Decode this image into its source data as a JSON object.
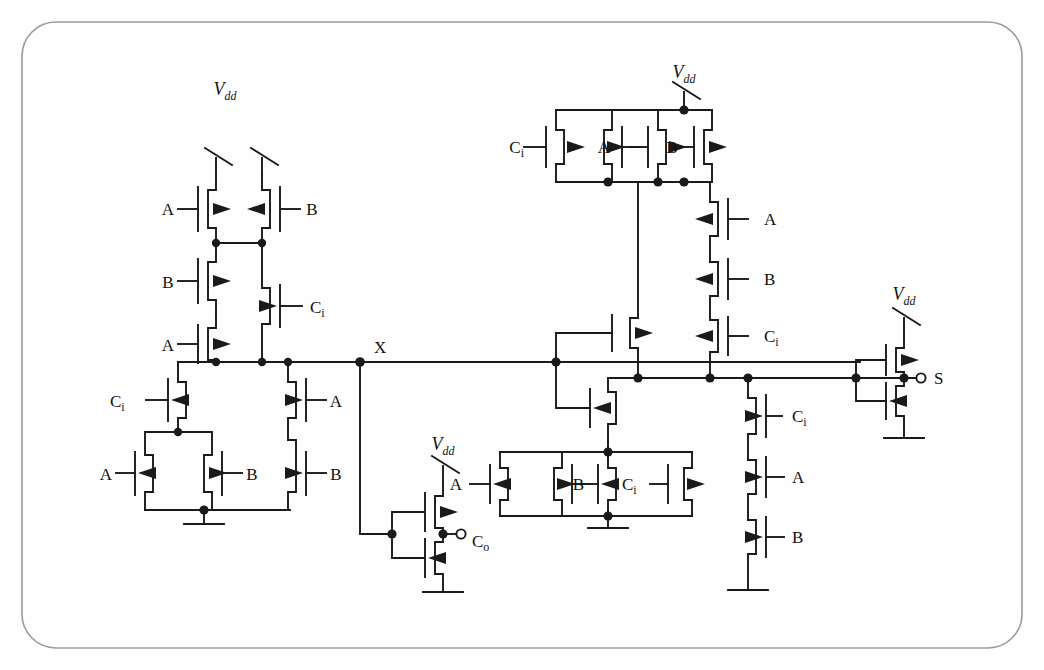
{
  "figure": {
    "kind": "cmos-circuit-schematic",
    "background": "#fefefe",
    "wire_color": "#1a1a1a",
    "border": {
      "shape": "rounded-rectangle",
      "color": "#8a8a8a",
      "radius": 34
    }
  },
  "signals": {
    "a": "A",
    "b": "B",
    "ci": "C",
    "ci_sub": "i",
    "co": "C",
    "co_sub": "o",
    "sum": "S",
    "vdd": "V",
    "vdd_sub": "dd",
    "node_x": "X"
  },
  "nets": [
    {
      "name": "X",
      "label": "X",
      "type": "internal-node"
    },
    {
      "name": "Co",
      "label": "C_o",
      "type": "output-terminal"
    },
    {
      "name": "S",
      "label": "S",
      "type": "output-terminal"
    }
  ],
  "blocks": [
    {
      "id": "carry-pull-up",
      "role": "PMOS pull-up network for carry (drives node X)",
      "supply": "Vdd",
      "devices": [
        {
          "id": "p-a-top",
          "type": "pmos",
          "gate": "A"
        },
        {
          "id": "p-b-top",
          "type": "pmos",
          "gate": "B"
        },
        {
          "id": "p-b-mid",
          "type": "pmos",
          "gate": "B"
        },
        {
          "id": "p-a-mid",
          "type": "pmos",
          "gate": "A"
        },
        {
          "id": "p-ci-right",
          "type": "pmos",
          "gate": "Ci"
        }
      ]
    },
    {
      "id": "carry-pull-down",
      "role": "NMOS pull-down network for carry (drives node X)",
      "ground": true,
      "devices": [
        {
          "id": "n-ci-left",
          "type": "nmos",
          "gate": "Ci"
        },
        {
          "id": "n-a-par",
          "type": "nmos",
          "gate": "A"
        },
        {
          "id": "n-b-par",
          "type": "nmos",
          "gate": "B"
        },
        {
          "id": "n-a-ser",
          "type": "nmos",
          "gate": "A"
        },
        {
          "id": "n-b-ser",
          "type": "nmos",
          "gate": "B"
        }
      ]
    },
    {
      "id": "carry-inverter",
      "role": "Inverter from node X to carry out",
      "supply": "Vdd",
      "output": "Co",
      "devices": [
        {
          "id": "inv-co-p",
          "type": "pmos",
          "gate": "X"
        },
        {
          "id": "inv-co-n",
          "type": "nmos",
          "gate": "X"
        }
      ]
    },
    {
      "id": "sum-pull-up",
      "role": "PMOS network for sum",
      "supply": "Vdd",
      "devices": [
        {
          "id": "sp-ci",
          "type": "pmos",
          "gate": "Ci"
        },
        {
          "id": "sp-a",
          "type": "pmos",
          "gate": "A"
        },
        {
          "id": "sp-b",
          "type": "pmos",
          "gate": "B"
        },
        {
          "id": "sp-x",
          "type": "pmos",
          "gate": "X"
        },
        {
          "id": "sp-ser-a",
          "type": "pmos",
          "gate": "A"
        },
        {
          "id": "sp-ser-b",
          "type": "pmos",
          "gate": "B"
        },
        {
          "id": "sp-ser-ci",
          "type": "pmos",
          "gate": "Ci"
        }
      ]
    },
    {
      "id": "sum-pull-down",
      "role": "NMOS network for sum",
      "ground": true,
      "devices": [
        {
          "id": "sn-x",
          "type": "nmos",
          "gate": "X"
        },
        {
          "id": "sn-a",
          "type": "nmos",
          "gate": "A"
        },
        {
          "id": "sn-b",
          "type": "nmos",
          "gate": "B"
        },
        {
          "id": "sn-ci",
          "type": "nmos",
          "gate": "Ci"
        },
        {
          "id": "sn-x2",
          "type": "nmos",
          "gate": "X"
        },
        {
          "id": "sn-ser-ci",
          "type": "nmos",
          "gate": "Ci"
        },
        {
          "id": "sn-ser-a",
          "type": "nmos",
          "gate": "A"
        },
        {
          "id": "sn-ser-b",
          "type": "nmos",
          "gate": "B"
        }
      ]
    },
    {
      "id": "sum-inverter",
      "role": "Output inverter producing S",
      "supply": "Vdd",
      "output": "S",
      "devices": [
        {
          "id": "inv-s-p",
          "type": "pmos"
        },
        {
          "id": "inv-s-n",
          "type": "nmos"
        }
      ]
    }
  ],
  "labels": [
    {
      "id": "vdd-left",
      "text": "Vdd",
      "x": 225,
      "y": 95
    },
    {
      "id": "a-left-1",
      "text": "A",
      "x": 168,
      "y": 207
    },
    {
      "id": "b-left-1",
      "text": "B",
      "x": 312,
      "y": 207
    },
    {
      "id": "b-left-2",
      "text": "B",
      "x": 168,
      "y": 285
    },
    {
      "id": "ci-left-1",
      "text": "Ci",
      "x": 312,
      "y": 312
    },
    {
      "id": "a-left-2",
      "text": "A",
      "x": 168,
      "y": 327
    },
    {
      "id": "ci-left-2",
      "text": "Ci",
      "x": 125,
      "y": 405
    },
    {
      "id": "a-left-3",
      "text": "A",
      "x": 318,
      "y": 405
    },
    {
      "id": "a-left-4",
      "text": "A",
      "x": 132,
      "y": 478
    },
    {
      "id": "b-left-3",
      "text": "B",
      "x": 246,
      "y": 478
    },
    {
      "id": "b-left-4",
      "text": "B",
      "x": 318,
      "y": 478
    },
    {
      "id": "x-node",
      "text": "X",
      "x": 372,
      "y": 353
    },
    {
      "id": "vdd-co",
      "text": "Vdd",
      "x": 432,
      "y": 442
    },
    {
      "id": "co-term",
      "text": "Co",
      "x": 470,
      "y": 546
    },
    {
      "id": "ci-top-right",
      "text": "Ci",
      "x": 540,
      "y": 148
    },
    {
      "id": "a-top-right",
      "text": "A",
      "x": 610,
      "y": 148
    },
    {
      "id": "b-top-right",
      "text": "B",
      "x": 682,
      "y": 148
    },
    {
      "id": "a-ser-right",
      "text": "A",
      "x": 762,
      "y": 230
    },
    {
      "id": "b-ser-right",
      "text": "B",
      "x": 762,
      "y": 288
    },
    {
      "id": "ci-ser-right",
      "text": "Ci",
      "x": 762,
      "y": 340
    },
    {
      "id": "ci-low-right",
      "text": "Ci",
      "x": 790,
      "y": 425
    },
    {
      "id": "a-low-right",
      "text": "A",
      "x": 790,
      "y": 485
    },
    {
      "id": "b-low-right",
      "text": "B",
      "x": 790,
      "y": 545
    },
    {
      "id": "a-bot-mid",
      "text": "A",
      "x": 488,
      "y": 482
    },
    {
      "id": "b-bot-mid",
      "text": "B",
      "x": 556,
      "y": 482
    },
    {
      "id": "ci-bot-mid",
      "text": "Ci",
      "x": 620,
      "y": 482
    },
    {
      "id": "vdd-right",
      "text": "Vdd",
      "x": 882,
      "y": 292
    },
    {
      "id": "s-term",
      "text": "S",
      "x": 912,
      "y": 380
    }
  ]
}
